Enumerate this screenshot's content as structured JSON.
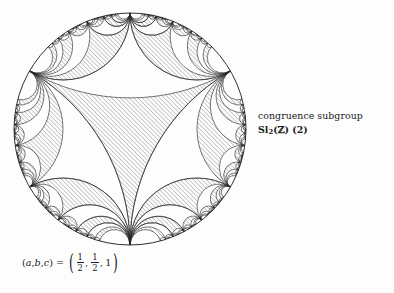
{
  "figure": {
    "type": "hyperbolic-tessellation",
    "model": "poincare-disk",
    "title_lines": {
      "line1": "congruence subgroup",
      "line2_prefix": "Sl",
      "line2_sub": "2",
      "line2_open": "(",
      "line2_z": "ℤ",
      "line2_close": ")",
      "line2_level": " (2)"
    },
    "parameters": {
      "label_open": "(",
      "a": "a",
      "comma1": ", ",
      "b": "b",
      "comma2": ", ",
      "c": "c",
      "label_close": ")",
      "equals": "=",
      "tuple_open": "(",
      "val_a_num": "1",
      "val_a_den": "2",
      "sep1": ",",
      "val_b_num": "1",
      "val_b_den": "2",
      "sep2": ",",
      "val_c": "1",
      "tuple_close": ")"
    },
    "geometry": {
      "center_x": 130,
      "center_y": 129,
      "radius": 116,
      "ideal_vertex_count": 6,
      "vertex_angles_deg": [
        270,
        330,
        30,
        90,
        150,
        210
      ],
      "subdivision_depth": 5
    },
    "colors": {
      "background": "#fdfdfd",
      "stroke": "#2b2b2b",
      "hatch": "#8d8d8d",
      "text": "#1a1a1a",
      "boundary": "#232323"
    }
  },
  "chart_data": {
    "type": "diagram",
    "subtitle": "(a, b, c) = (1/2, 1/2, 1)",
    "model": "Poincare disk",
    "orbifold_parameters": {
      "a": 0.5,
      "b": 0.5,
      "c": 1
    },
    "fundamental_domain": "ideal hexagon",
    "ideal_vertices_deg": [
      270,
      330,
      30,
      90,
      150,
      210
    ],
    "shaded_regions": "alternating ideal triangles (hatched)",
    "xlabel": "",
    "ylabel": ""
  }
}
